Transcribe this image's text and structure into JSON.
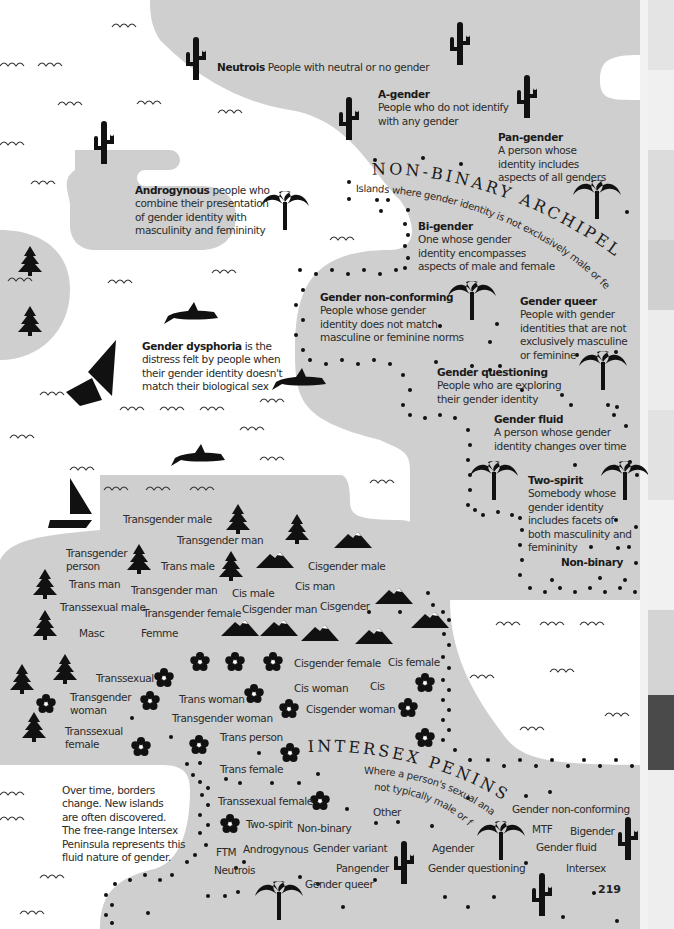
{
  "page": {
    "number": "219"
  },
  "colors": {
    "land": "#cfcfcf",
    "sea": "#ffffff",
    "ink": "#111111",
    "text": "#2b2b2b"
  },
  "edge_strip": [
    "#e4e4e4",
    "#d6d6d6",
    "#f0f0f0",
    "#dcdcdc",
    "#c4c4c4",
    "#ececec",
    "#e2e2e2",
    "#d9d9d9",
    "#f1f1f1",
    "#d0d0d0",
    "#4a4a4a",
    "#eeeeee",
    "#e6e6e6"
  ],
  "nonbinary": {
    "title": "NON-BINARY ARCHIPELAGO",
    "subtitle": "Islands where gender identity is not exclusively male or female",
    "entries": [
      {
        "term": "Neutrois",
        "def": "People with neutral or no gender"
      },
      {
        "term": "A-gender",
        "def_lines": [
          "People who do not identify",
          "with any gender"
        ]
      },
      {
        "term": "Pan-gender",
        "def_lines": [
          "A person whose",
          "identity includes",
          "aspects of all genders"
        ]
      },
      {
        "term": "Bi-gender",
        "def_lines": [
          "One whose gender",
          "identity encompasses",
          "aspects of male and female"
        ]
      },
      {
        "term": "Gender non-conforming",
        "def_lines": [
          "People whose gender",
          "identity does not match",
          "masculine or feminine norms"
        ]
      },
      {
        "term": "Gender queer",
        "def_lines": [
          "People with gender",
          "identities that are not",
          "exclusively masculine",
          "or feminine"
        ]
      },
      {
        "term": "Gender questioning",
        "def_lines": [
          "People who are exploring",
          "their gender identity"
        ]
      },
      {
        "term": "Gender fluid",
        "def_lines": [
          "A person whose gender",
          "identity changes over time"
        ]
      },
      {
        "term": "Two-spirit",
        "def_lines": [
          "Somebody whose",
          "gender identity",
          "includes facets of",
          "both masculinity and",
          "femininity"
        ]
      },
      {
        "term": "Non-binary"
      }
    ]
  },
  "androgynous": {
    "term": "Androgynous",
    "def_first": "people who",
    "def_lines": [
      "combine their presentation",
      "of gender identity with",
      "masculinity and femininity"
    ]
  },
  "dysphoria": {
    "term": "Gender dysphoria",
    "def_first": "is the",
    "def_lines": [
      "distress felt by people when",
      "their gender identity doesn't",
      "match their biological sex"
    ]
  },
  "mainland": {
    "labels": [
      "Transgender male",
      "Transgender man",
      "Transgender person",
      "Trans male",
      "Cisgender male",
      "Trans man",
      "Transgender man",
      "Cis male",
      "Cis man",
      "Transsexual male",
      "Transgender female",
      "Cisgender man",
      "Cisgender",
      "Masc",
      "Femme",
      "Transsexual",
      "Cisgender female",
      "Cis female",
      "Transgender woman",
      "Trans woman",
      "Cis woman",
      "Cis",
      "Transgender woman",
      "Cisgender woman",
      "Transsexual female",
      "Trans person",
      "Trans female"
    ]
  },
  "intersex": {
    "title": "INTERSEX PENINSULA",
    "subtitle_lines": [
      "Where a person's sexual anatomy is",
      "not typically male or female"
    ],
    "labels": [
      "Transsexual female",
      "Two-spirit",
      "Non-binary",
      "Other",
      "Gender non-conforming",
      "MTF",
      "Bigender",
      "FTM",
      "Androgynous",
      "Gender variant",
      "Agender",
      "Gender fluid",
      "Neutrois",
      "Pangender",
      "Gender questioning",
      "Intersex",
      "Gender queer"
    ]
  },
  "note": {
    "lines": [
      "Over time, borders",
      "change. New islands",
      "are often discovered.",
      "The free-range Intersex",
      "Peninsula represents this",
      "fluid nature of gender."
    ]
  }
}
